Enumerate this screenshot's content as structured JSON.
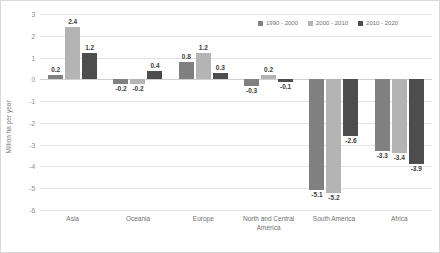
{
  "chart_data": {
    "type": "bar",
    "title": "",
    "xlabel": "",
    "ylabel": "Million ha per year",
    "ylim": [
      -6,
      3
    ],
    "ytick_step": 1,
    "grid": true,
    "legend_position": "top-right",
    "categories": [
      "Asia",
      "Oceania",
      "Europe",
      "North and Central America",
      "South America",
      "Africa"
    ],
    "yticks": [
      "3",
      "2",
      "1",
      "0",
      "-1",
      "-2",
      "-3",
      "-4",
      "-5",
      "-6"
    ],
    "series": [
      {
        "name": "1990 - 2000",
        "color": "#808080",
        "values": [
          0.2,
          -0.2,
          0.8,
          -0.3,
          -5.1,
          -3.3
        ],
        "labels": [
          "0.2",
          "-0.2",
          "0.8",
          "-0.3",
          "-5.1",
          "-3.3"
        ]
      },
      {
        "name": "2000 - 2010",
        "color": "#b4b4b4",
        "values": [
          2.4,
          -0.2,
          1.2,
          0.2,
          -5.2,
          -3.4
        ],
        "labels": [
          "2.4",
          "-0.2",
          "1.2",
          "0.2",
          "-5.2",
          "-3.4"
        ]
      },
      {
        "name": "2010 - 2020",
        "color": "#4d4d4d",
        "values": [
          1.2,
          0.4,
          0.3,
          -0.1,
          -2.6,
          -3.9
        ],
        "labels": [
          "1.2",
          "0.4",
          "0.3",
          "-0.1",
          "-2.6",
          "-3.9"
        ]
      }
    ]
  },
  "colors": {
    "series_1": "#808080",
    "series_2": "#b4b4b4",
    "series_3": "#4d4d4d",
    "gridline": "#e3e3e3",
    "text": "#6f6f6f",
    "label_text": "#404040",
    "background": "#ffffff"
  }
}
